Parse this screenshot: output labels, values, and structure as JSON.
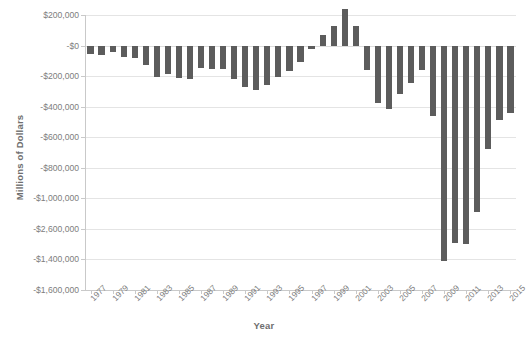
{
  "chart_data": {
    "type": "bar",
    "title": "",
    "xlabel": "Year",
    "ylabel": "Millions of Dollars",
    "grid": true,
    "legend": false,
    "ylim": [
      -1600000,
      200000
    ],
    "ytick_labels": [
      "$200,000",
      "-$0",
      "-$200,000",
      "-$400,000",
      "-$600,000",
      "-$800,000",
      "-$1,000,000",
      "-$2,600,000",
      "-$1,400,000",
      "-$1,600,000"
    ],
    "ytick_values": [
      200000,
      0,
      -200000,
      -400000,
      -600000,
      -800000,
      -1000000,
      -1200000,
      -1400000,
      -1600000
    ],
    "xtick_labels": [
      "1977",
      "1979",
      "1981",
      "1983",
      "1985",
      "1987",
      "1989",
      "1991",
      "1993",
      "1995",
      "1997",
      "1999",
      "2001",
      "2003",
      "2005",
      "2007",
      "2009",
      "2011",
      "2013",
      "2015"
    ],
    "bar_color": "#5c5c5c",
    "categories": [
      1977,
      1978,
      1979,
      1980,
      1981,
      1982,
      1983,
      1984,
      1985,
      1986,
      1987,
      1988,
      1989,
      1990,
      1991,
      1992,
      1993,
      1994,
      1995,
      1996,
      1997,
      1998,
      1999,
      2000,
      2001,
      2002,
      2003,
      2004,
      2005,
      2006,
      2007,
      2008,
      2009,
      2010,
      2011,
      2012,
      2013,
      2014,
      2015
    ],
    "values": [
      -53700,
      -59200,
      -40700,
      -73800,
      -79000,
      -128000,
      -207800,
      -185400,
      -212300,
      -221200,
      -149700,
      -155200,
      -152600,
      -221000,
      -269200,
      -290300,
      -255100,
      -203200,
      -164000,
      -107400,
      -21900,
      69300,
      125600,
      236200,
      128200,
      -157800,
      -377600,
      -412700,
      -318300,
      -248200,
      -160700,
      -458600,
      -1412700,
      -1294400,
      -1299600,
      -1087000,
      -679500,
      -484600,
      -438900
    ]
  }
}
